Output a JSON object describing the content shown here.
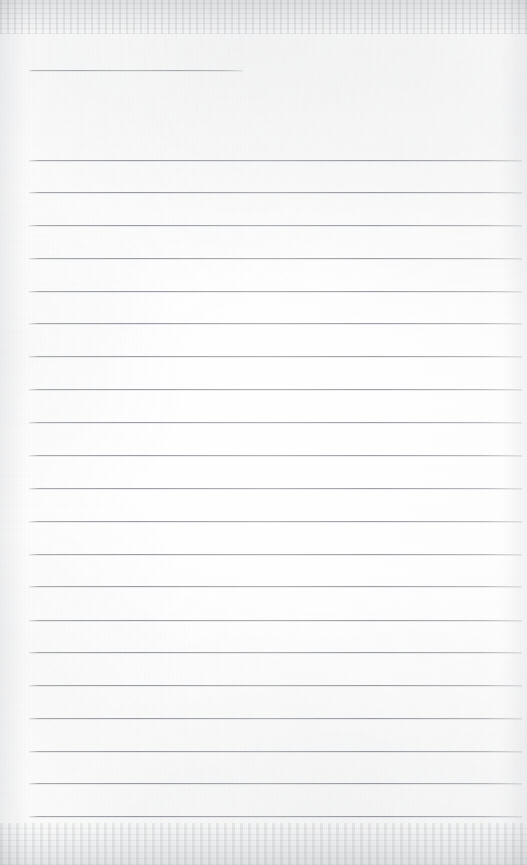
{
  "document": {
    "kind": "scanned-ruled-notebook-page",
    "title": "",
    "page_width": 527,
    "page_height": 865,
    "background_color": "#fdfdfd",
    "rule_color": "#7e838a",
    "edge_shadow_color": "#92979e",
    "written_content": [],
    "body_text": "",
    "notes_placeholder": ""
  },
  "ruling": {
    "line_count_total": 22,
    "header_rule_count": 1,
    "body_rule_count": 21,
    "line_spacing_px": 32.7,
    "left_margin_px": 29,
    "right_margin_px": 522,
    "rule_thickness_px": 1,
    "header_rule": {
      "label": "header-rule",
      "y": 70,
      "x_start": 29,
      "x_end": 243,
      "width": 214
    },
    "body_rules": [
      {
        "index": 1,
        "y": 160,
        "x_start": 29,
        "x_end": 522
      },
      {
        "index": 2,
        "y": 192,
        "x_start": 29,
        "x_end": 522
      },
      {
        "index": 3,
        "y": 225,
        "x_start": 29,
        "x_end": 522
      },
      {
        "index": 4,
        "y": 258,
        "x_start": 29,
        "x_end": 522
      },
      {
        "index": 5,
        "y": 291,
        "x_start": 29,
        "x_end": 522
      },
      {
        "index": 6,
        "y": 323,
        "x_start": 29,
        "x_end": 522
      },
      {
        "index": 7,
        "y": 356,
        "x_start": 29,
        "x_end": 522
      },
      {
        "index": 8,
        "y": 389,
        "x_start": 29,
        "x_end": 522
      },
      {
        "index": 9,
        "y": 422,
        "x_start": 29,
        "x_end": 522
      },
      {
        "index": 10,
        "y": 455,
        "x_start": 29,
        "x_end": 522
      },
      {
        "index": 11,
        "y": 488,
        "x_start": 29,
        "x_end": 522
      },
      {
        "index": 12,
        "y": 521,
        "x_start": 29,
        "x_end": 522
      },
      {
        "index": 13,
        "y": 554,
        "x_start": 29,
        "x_end": 522
      },
      {
        "index": 14,
        "y": 586,
        "x_start": 29,
        "x_end": 522
      },
      {
        "index": 15,
        "y": 620,
        "x_start": 29,
        "x_end": 522
      },
      {
        "index": 16,
        "y": 652,
        "x_start": 29,
        "x_end": 522
      },
      {
        "index": 17,
        "y": 685,
        "x_start": 29,
        "x_end": 522
      },
      {
        "index": 18,
        "y": 718,
        "x_start": 29,
        "x_end": 522
      },
      {
        "index": 19,
        "y": 751,
        "x_start": 29,
        "x_end": 522
      },
      {
        "index": 20,
        "y": 783,
        "x_start": 29,
        "x_end": 522
      },
      {
        "index": 21,
        "y": 816,
        "x_start": 29,
        "x_end": 522
      }
    ]
  }
}
